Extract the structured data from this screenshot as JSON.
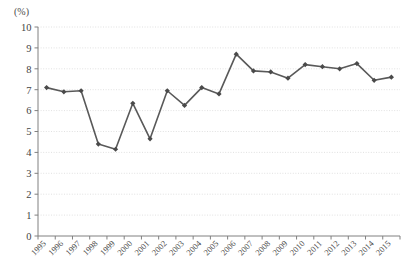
{
  "chart_data": {
    "type": "line",
    "title": "",
    "subtitle": "",
    "xlabel": "",
    "ylabel": "(%)",
    "unit_label": "(%)",
    "categories": [
      "1995",
      "1996",
      "1997",
      "1998",
      "1999",
      "2000",
      "2001",
      "2002",
      "2003",
      "2004",
      "2005",
      "2006",
      "2007",
      "2008",
      "2009",
      "2010",
      "2011",
      "2012",
      "2013",
      "2014",
      "2015"
    ],
    "values": [
      7.1,
      6.9,
      6.95,
      4.4,
      4.15,
      6.35,
      4.65,
      6.95,
      6.25,
      7.1,
      6.8,
      8.7,
      7.9,
      7.85,
      7.55,
      8.2,
      8.1,
      8.0,
      8.25,
      7.45,
      7.6
    ],
    "series": [
      {
        "name": "",
        "values": [
          7.1,
          6.9,
          6.95,
          4.4,
          4.15,
          6.35,
          4.65,
          6.95,
          6.25,
          7.1,
          6.8,
          8.7,
          7.9,
          7.85,
          7.55,
          8.2,
          8.1,
          8.0,
          8.25,
          7.45,
          7.6
        ]
      }
    ],
    "ylim": [
      0,
      10
    ],
    "yticks": [
      0,
      1,
      2,
      3,
      4,
      5,
      6,
      7,
      8,
      9,
      10
    ],
    "ytick_labels": [
      "0",
      "1",
      "2",
      "3",
      "4",
      "5",
      "6",
      "7",
      "8",
      "9",
      "10"
    ],
    "grid": true,
    "grid_axis": "y",
    "grid_style": "dotted",
    "legend": false,
    "legend_position": "none",
    "marker": "diamond",
    "line_color": "#595959",
    "marker_color": "#4a4a4a",
    "grid_color": "#d9d9d9",
    "axis_color": "#808080",
    "background_color": "#ffffff",
    "xtick_rotation": -45
  }
}
